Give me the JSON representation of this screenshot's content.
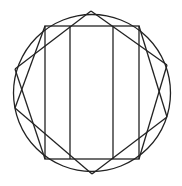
{
  "diagram": {
    "title": "",
    "stroke_color": "#222222",
    "background": "#ffffff",
    "circle": {
      "cx": 92,
      "cy": 93,
      "r": 78.5
    },
    "outer_rectangle": {
      "x1": 45,
      "y1": 26,
      "x2": 139,
      "y2": 159
    },
    "inner_verticals": [
      70,
      113
    ],
    "vertices": {
      "top": [
        91,
        11
      ],
      "bottom": [
        92,
        174
      ],
      "left_upper": [
        15,
        69
      ],
      "left_lower": [
        15,
        108
      ],
      "right_upper": [
        167,
        65
      ],
      "right_lower": [
        167,
        117
      ]
    },
    "lines": [
      [
        [
          15,
          69
        ],
        [
          91,
          11
        ]
      ],
      [
        [
          91,
          11
        ],
        [
          167,
          65
        ]
      ],
      [
        [
          15,
          108
        ],
        [
          92,
          174
        ]
      ],
      [
        [
          92,
          174
        ],
        [
          167,
          117
        ]
      ],
      [
        [
          45,
          26
        ],
        [
          15,
          108
        ]
      ],
      [
        [
          15,
          69
        ],
        [
          45,
          159
        ]
      ],
      [
        [
          139,
          26
        ],
        [
          167,
          117
        ]
      ],
      [
        [
          167,
          65
        ],
        [
          139,
          159
        ]
      ]
    ]
  }
}
